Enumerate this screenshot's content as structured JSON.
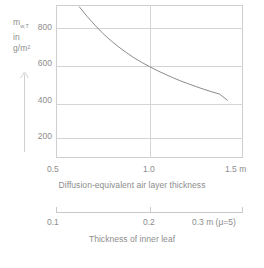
{
  "axis_y": {
    "symbol": "m",
    "subscript": "w,T",
    "line2": "in",
    "line3": "g/m²",
    "arrow_icon": "up-arrow-icon",
    "ticks": [
      "800",
      "600",
      "400",
      "200"
    ]
  },
  "axis_x_primary": {
    "caption": "Diffusion-equivalent air layer thickness",
    "ticks": [
      "0.5",
      "1.0",
      "1.5 m"
    ]
  },
  "axis_x_secondary": {
    "caption": "Thickness of inner leaf",
    "ticks": [
      "0.1",
      "0.2",
      "0.3 m (μ=5)"
    ]
  },
  "colors": {
    "grid": "#d4d4d4",
    "frame": "#cfcfcf",
    "curve": "#7d7d7d",
    "text": "#8d8d8d"
  },
  "chart_data": {
    "type": "line",
    "title": "",
    "xlabel": "Diffusion-equivalent air layer thickness",
    "ylabel": "m_w,T in g/m²",
    "xlim": [
      0.4,
      1.6
    ],
    "ylim": [
      100,
      900
    ],
    "xticks": [
      0.5,
      1.0,
      1.5
    ],
    "yticks": [
      200,
      400,
      600,
      800
    ],
    "grid": true,
    "legend": "none",
    "secondary_xlabel": "Thickness of inner leaf",
    "secondary_xticks": [
      0.1,
      0.2,
      0.3
    ],
    "secondary_note": "μ=5",
    "series": [
      {
        "name": "Accumulated condensation water",
        "x": [
          0.55,
          0.6,
          0.65,
          0.7,
          0.75,
          0.8,
          0.85,
          0.9,
          0.95,
          1.0,
          1.05,
          1.1,
          1.15,
          1.2,
          1.25,
          1.3,
          1.35,
          1.4,
          1.45,
          1.5
        ],
        "values": [
          890,
          840,
          795,
          752,
          715,
          682,
          652,
          624,
          600,
          578,
          557,
          538,
          520,
          503,
          488,
          473,
          459,
          446,
          434,
          402
        ]
      }
    ]
  }
}
